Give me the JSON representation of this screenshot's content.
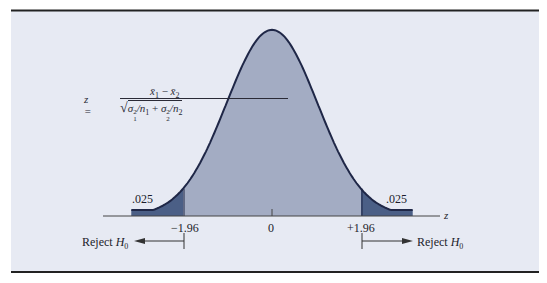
{
  "chart_data": {
    "type": "area",
    "title": "",
    "xlabel": "z",
    "ylabel": "",
    "x_ticks": [
      {
        "value": -1.96,
        "label": "−1.96"
      },
      {
        "value": 0,
        "label": "0"
      },
      {
        "value": 1.96,
        "label": "+1.96"
      }
    ],
    "xlim": [
      -3.1,
      3.1
    ],
    "grid": false,
    "legend": null,
    "distribution": {
      "name": "standard normal",
      "mean": 0,
      "sd": 1
    },
    "regions": [
      {
        "name": "left rejection tail",
        "from": -3.1,
        "to": -1.96,
        "area": 0.025,
        "label": ".025",
        "color": "#4b5f86"
      },
      {
        "name": "non-rejection region",
        "from": -1.96,
        "to": 1.96,
        "area": 0.95,
        "color": "#a3acc3"
      },
      {
        "name": "right rejection tail",
        "from": 1.96,
        "to": 3.1,
        "area": 0.025,
        "label": ".025",
        "color": "#4b5f86"
      }
    ],
    "annotations": [
      {
        "text": "Reject H0",
        "position": "left of -1.96",
        "arrow": "left"
      },
      {
        "text": "Reject H0",
        "position": "right of +1.96",
        "arrow": "right"
      },
      {
        "text": "z = (x̄1 − x̄2) / sqrt(σ1²/n1 + σ2²/n2)",
        "position": "upper left"
      }
    ]
  },
  "labels": {
    "axis_var": "z",
    "tail_left": ".025",
    "tail_right": ".025",
    "tick_left": "−1.96",
    "tick_center": "0",
    "tick_right": "+1.96",
    "reject": "Reject ",
    "h": "H",
    "h_sub": "0"
  },
  "formula": {
    "lhs": "z =",
    "num_x1": "x̄",
    "num_sub1": "1",
    "num_minus": " − ",
    "num_x2": "x̄",
    "num_sub2": "2",
    "den_sqrt": "√",
    "den_s1": "σ",
    "den_sup1": "2",
    "den_sub1": "1",
    "den_n1": "/n",
    "den_n1sub": "1",
    "den_plus": " + ",
    "den_s2": "σ",
    "den_sup2": "2",
    "den_sub2": "2",
    "den_n2": "/n",
    "den_n2sub": "2"
  },
  "colors": {
    "panel_bg": "#e7eaf3",
    "body_fill": "#a3acc3",
    "tail_fill": "#4b5f86",
    "curve_stroke": "#1f2747",
    "rule": "#222222",
    "axis": "#444444"
  }
}
